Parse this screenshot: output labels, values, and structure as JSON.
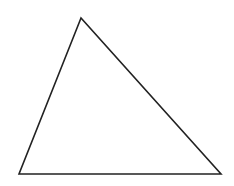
{
  "diagram": {
    "shape": "triangle",
    "background": "#ffffff",
    "stroke_color": "#222222",
    "stroke_width": 1.6,
    "fill": "none",
    "vertices": [
      {
        "name": "apex",
        "x": 81,
        "y": 18
      },
      {
        "name": "bottom-left",
        "x": 19,
        "y": 174
      },
      {
        "name": "bottom-right",
        "x": 221,
        "y": 174
      }
    ]
  }
}
